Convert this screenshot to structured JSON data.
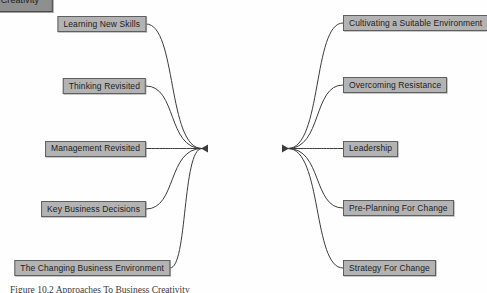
{
  "diagram": {
    "type": "mind-map",
    "title": "Business Creativity",
    "background_color": "#fefefe",
    "center_node": {
      "label": "Business Creativity",
      "x": 245,
      "y": 148.5,
      "fill": "#8f8f8f",
      "stroke": "#4a4a4a"
    },
    "node_fill": "#b3b3b3",
    "node_stroke": "#5f5f5f",
    "edge_color": "#3c3c3c",
    "left_branches": [
      {
        "label": "Learning New Skills",
        "x": 146,
        "y": 24
      },
      {
        "label": "Thinking Revisited",
        "x": 146,
        "y": 86
      },
      {
        "label": "Management Revisited",
        "x": 146,
        "y": 148.5
      },
      {
        "label": "Key Business Decisions",
        "x": 146,
        "y": 209
      },
      {
        "label": "The Changing Business Environment",
        "x": 170,
        "y": 268
      }
    ],
    "right_branches": [
      {
        "label": "Cultivating a Suitable Environment",
        "x": 343,
        "y": 23
      },
      {
        "label": "Overcoming Resistance",
        "x": 343,
        "y": 85
      },
      {
        "label": "Leadership",
        "x": 343,
        "y": 148.5
      },
      {
        "label": "Pre-Planning For Change",
        "x": 343,
        "y": 208
      },
      {
        "label": "Strategy For Change",
        "x": 343,
        "y": 268
      }
    ],
    "caption": "Figure 10.2 Approaches To Business Creativity"
  }
}
